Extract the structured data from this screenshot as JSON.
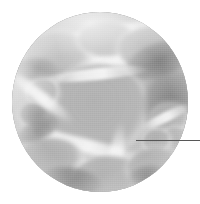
{
  "figure": {
    "caption": "",
    "background_color": "#ffffff",
    "modality": "light-micrograph",
    "color_mode": "grayscale"
  },
  "micrograph": {
    "shape": "circle",
    "field_of_view_label": "",
    "center_x": 100,
    "center_y": 102,
    "diameter": 176,
    "base_color": "#bdbdbd",
    "wall_color": "#f2f2f2",
    "lumen_color": "#b4b4b4",
    "dark_color": "#7d7d7d"
  },
  "annotation": {
    "leader_line": {
      "label": "",
      "color": "#575757",
      "x_start": 136,
      "x_end": 200,
      "y": 140,
      "thickness": 1,
      "points_to": "cell-wall-junction"
    }
  },
  "structures": [
    {
      "name": "central-large-cell",
      "cx": 98,
      "cy": 104,
      "rx": 44,
      "ry": 40
    },
    {
      "name": "upper-left-cell",
      "cx": 52,
      "cy": 52,
      "rx": 30,
      "ry": 22
    },
    {
      "name": "upper-right-cell",
      "cx": 136,
      "cy": 46,
      "rx": 40,
      "ry": 24
    },
    {
      "name": "left-small-cell",
      "cx": 34,
      "cy": 92,
      "rx": 13,
      "ry": 11
    },
    {
      "name": "right-cell-cluster",
      "cx": 160,
      "cy": 116,
      "rx": 20,
      "ry": 18
    },
    {
      "name": "lower-left-cell",
      "cx": 46,
      "cy": 150,
      "rx": 24,
      "ry": 20
    },
    {
      "name": "lower-center-cell",
      "cx": 104,
      "cy": 168,
      "rx": 28,
      "ry": 20
    },
    {
      "name": "lower-right-cell",
      "cx": 152,
      "cy": 162,
      "rx": 20,
      "ry": 16
    },
    {
      "name": "dark-patch-left",
      "cx": 30,
      "cy": 112,
      "rx": 12,
      "ry": 8
    },
    {
      "name": "dark-patch-right",
      "cx": 172,
      "cy": 92,
      "rx": 14,
      "ry": 20
    }
  ]
}
